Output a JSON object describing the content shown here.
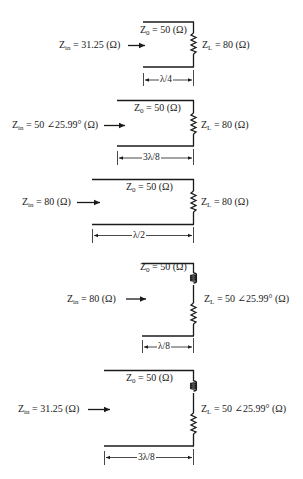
{
  "panels": [
    {
      "zin_sym": "Z",
      "zin_sub": "in",
      "zin_value": "= 31.25 (Ω)",
      "z0_sym": "Z",
      "z0_sub": "0",
      "z0_value": "= 50 (Ω)",
      "zl_sym": "Z",
      "zl_sub": "L",
      "zl_value": "= 80 (Ω)",
      "length": "λ/4",
      "load": "resistor"
    },
    {
      "zin_sym": "Z",
      "zin_sub": "in",
      "zin_value": "= 50 ∠25.99° (Ω)",
      "z0_sym": "Z",
      "z0_sub": "0",
      "z0_value": "= 50 (Ω)",
      "zl_sym": "Z",
      "zl_sub": "L",
      "zl_value": "= 80 (Ω)",
      "length": "3λ/8",
      "load": "resistor"
    },
    {
      "zin_sym": "Z",
      "zin_sub": "in",
      "zin_value": "= 80 (Ω)",
      "z0_sym": "Z",
      "z0_sub": "0",
      "z0_value": "= 50 (Ω)",
      "zl_sym": "Z",
      "zl_sub": "L",
      "zl_value": "= 80 (Ω)",
      "length": "λ/2",
      "load": "resistor"
    },
    {
      "zin_sym": "Z",
      "zin_sub": "in",
      "zin_value": "= 80 (Ω)",
      "z0_sym": "Z",
      "z0_sub": "0",
      "z0_value": "= 50 (Ω)",
      "zl_sym": "Z",
      "zl_sub": "L",
      "zl_value": "= 50 ∠25.99° (Ω)",
      "length": "λ/8",
      "load": "inductor-resistor"
    },
    {
      "zin_sym": "Z",
      "zin_sub": "in",
      "zin_value": "= 31.25 (Ω)",
      "z0_sym": "Z",
      "z0_sub": "0",
      "z0_value": "= 50 (Ω)",
      "zl_sym": "Z",
      "zl_sub": "L",
      "zl_value": "= 50 ∠25.99° (Ω)",
      "length": "3λ/8",
      "load": "inductor-resistor"
    }
  ]
}
